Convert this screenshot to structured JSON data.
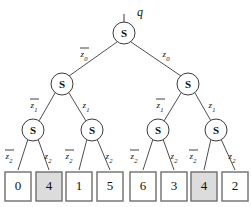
{
  "diagram": {
    "type": "binary-decision-tree",
    "root": {
      "node_label": "S",
      "input_label": "q",
      "cx": 124,
      "cy": 33,
      "r": 11
    },
    "node_label": "S",
    "levels": [
      {
        "level": 1,
        "nodes": [
          {
            "id": "n1-0",
            "label": "S",
            "cx": 62,
            "cy": 84,
            "r": 11
          },
          {
            "id": "n1-1",
            "label": "S",
            "cx": 188,
            "cy": 84,
            "r": 11
          }
        ],
        "edge_labels": [
          {
            "id": "e0-left",
            "base": "z",
            "sub": "0",
            "bar": true,
            "x": 85,
            "y": 53
          },
          {
            "id": "e0-right",
            "base": "z",
            "sub": "0",
            "bar": false,
            "x": 166,
            "y": 53
          }
        ]
      },
      {
        "level": 2,
        "nodes": [
          {
            "id": "n2-0",
            "label": "S",
            "cx": 33,
            "cy": 130,
            "r": 11
          },
          {
            "id": "n2-1",
            "label": "S",
            "cx": 92,
            "cy": 130,
            "r": 11
          },
          {
            "id": "n2-2",
            "label": "S",
            "cx": 158,
            "cy": 130,
            "r": 11
          },
          {
            "id": "n2-3",
            "label": "S",
            "cx": 216,
            "cy": 130,
            "r": 11
          }
        ],
        "edge_labels": [
          {
            "id": "e1-l-left",
            "base": "z",
            "sub": "1",
            "bar": true,
            "x": 35,
            "y": 105
          },
          {
            "id": "e1-l-right",
            "base": "z",
            "sub": "1",
            "bar": false,
            "x": 85,
            "y": 105
          },
          {
            "id": "e1-r-left",
            "base": "z",
            "sub": "1",
            "bar": true,
            "x": 161,
            "y": 105
          },
          {
            "id": "e1-r-right",
            "base": "z",
            "sub": "1",
            "bar": false,
            "x": 211,
            "y": 105
          }
        ]
      },
      {
        "level": 3,
        "edge_labels": [
          {
            "id": "e2-0",
            "base": "z",
            "sub": "2",
            "bar": true,
            "x": 10,
            "y": 156
          },
          {
            "id": "e2-1",
            "base": "z",
            "sub": "2",
            "bar": false,
            "x": 47,
            "y": 156
          },
          {
            "id": "e2-2",
            "base": "z",
            "sub": "2",
            "bar": true,
            "x": 70,
            "y": 156
          },
          {
            "id": "e2-3",
            "base": "z",
            "sub": "2",
            "bar": false,
            "x": 107,
            "y": 156
          },
          {
            "id": "e2-4",
            "base": "z",
            "sub": "2",
            "bar": true,
            "x": 135,
            "y": 156
          },
          {
            "id": "e2-5",
            "base": "z",
            "sub": "2",
            "bar": false,
            "x": 172,
            "y": 156
          },
          {
            "id": "e2-6",
            "base": "z",
            "sub": "2",
            "bar": true,
            "x": 193,
            "y": 156
          },
          {
            "id": "e2-7",
            "base": "z",
            "sub": "2",
            "bar": false,
            "x": 230,
            "y": 156
          }
        ]
      }
    ],
    "leaves": [
      {
        "id": "leaf-0",
        "value": "0",
        "x": 5,
        "y": 172,
        "w": 26,
        "h": 29,
        "shaded": false
      },
      {
        "id": "leaf-1",
        "value": "4",
        "x": 36,
        "y": 172,
        "w": 26,
        "h": 29,
        "shaded": true
      },
      {
        "id": "leaf-2",
        "value": "1",
        "x": 66,
        "y": 172,
        "w": 26,
        "h": 29,
        "shaded": false
      },
      {
        "id": "leaf-3",
        "value": "5",
        "x": 97,
        "y": 172,
        "w": 26,
        "h": 29,
        "shaded": false
      },
      {
        "id": "leaf-4",
        "value": "6",
        "x": 130,
        "y": 172,
        "w": 26,
        "h": 29,
        "shaded": false
      },
      {
        "id": "leaf-5",
        "value": "3",
        "x": 161,
        "y": 172,
        "w": 26,
        "h": 29,
        "shaded": false
      },
      {
        "id": "leaf-6",
        "value": "4",
        "x": 191,
        "y": 172,
        "w": 26,
        "h": 29,
        "shaded": true
      },
      {
        "id": "leaf-7",
        "value": "2",
        "x": 222,
        "y": 172,
        "w": 26,
        "h": 29,
        "shaded": false
      }
    ],
    "colors": {
      "line": "#3a3a3a",
      "leaf_border": "#6e6e6e",
      "leaf_fill": "#ffffff",
      "leaf_fill_shaded": "#dcdcdc",
      "text": "#111111",
      "background": "#ffffff"
    }
  }
}
